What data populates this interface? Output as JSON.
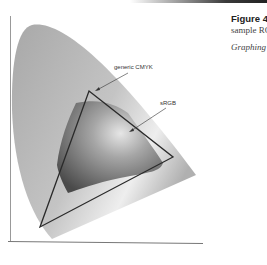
{
  "caption": {
    "title": "Figure 4.",
    "line1": "sample RC",
    "line2": "Graphing"
  },
  "diagram": {
    "type": "chromaticity gamut comparison",
    "labels": {
      "cmyk": "generic CMYK",
      "srgb": "sRGB"
    },
    "colors": {
      "locus_fill": "#b8b8b8",
      "triangle_stroke": "#2a2a2a",
      "srgb_fill": "#8a8a8a",
      "axis": "#888888"
    }
  }
}
